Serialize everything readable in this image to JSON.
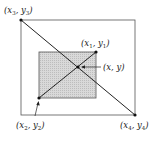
{
  "diagram": {
    "outer_rect": {
      "x": 21,
      "y": 20,
      "w": 114,
      "h": 95,
      "stroke": "#555555"
    },
    "inner_rect": {
      "x": 39,
      "y": 52,
      "w": 57,
      "h": 46,
      "fill": "#d4d4d4",
      "stroke": "#555555"
    },
    "points": {
      "p3": {
        "x": 21,
        "y": 20,
        "label": "(x3, y3)"
      },
      "p4": {
        "x": 135,
        "y": 115,
        "label": "(x4, y4)"
      },
      "p1": {
        "x": 96,
        "y": 52,
        "label": "(x1, y1)"
      },
      "p2": {
        "x": 39,
        "y": 98,
        "label": "(x2, y2)"
      },
      "intersection": {
        "x": 78,
        "y": 67,
        "label": "(x, y)"
      }
    },
    "labels": {
      "x3": "x",
      "x3_sub": "3",
      "y3": "y",
      "y3_sub": "3",
      "x1": "x",
      "x1_sub": "1",
      "y1": "y",
      "y1_sub": "1",
      "x2": "x",
      "x2_sub": "2",
      "y2": "y",
      "y2_sub": "2",
      "x4": "x",
      "x4_sub": "4",
      "y4": "y",
      "y4_sub": "4",
      "xy": "(x, y)"
    }
  }
}
